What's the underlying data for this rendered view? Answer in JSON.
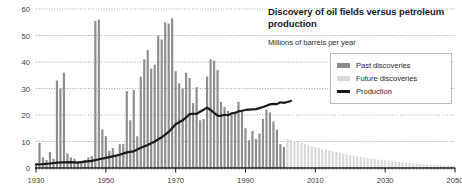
{
  "chart_data": {
    "type": "bar",
    "title": "Discovery of oil fields versus petroleum production",
    "subtitle": "Millions of barrels per year",
    "xlabel": "",
    "ylabel": "",
    "ylim": [
      0,
      60
    ],
    "xlim": [
      1930,
      2050
    ],
    "grid": true,
    "legend_position": "top-right",
    "y_ticks": [
      "0",
      "10",
      "20",
      "30",
      "40",
      "50",
      "60"
    ],
    "y_tick_values": [
      0,
      10,
      20,
      30,
      40,
      50,
      60
    ],
    "x_ticks": [
      "1930",
      "1950",
      "1970",
      "1990",
      "2010",
      "2030",
      "2050"
    ],
    "x_tick_values": [
      1930,
      1950,
      1970,
      1990,
      2010,
      2030,
      2050
    ],
    "series": [
      {
        "name": "Past discoveries",
        "type": "bar",
        "color": "#8d8d8d",
        "x": [
          1930,
          1931,
          1932,
          1933,
          1934,
          1935,
          1936,
          1937,
          1938,
          1939,
          1940,
          1941,
          1942,
          1943,
          1944,
          1945,
          1946,
          1947,
          1948,
          1949,
          1950,
          1951,
          1952,
          1953,
          1954,
          1955,
          1956,
          1957,
          1958,
          1959,
          1960,
          1961,
          1962,
          1963,
          1964,
          1965,
          1966,
          1967,
          1968,
          1969,
          1970,
          1971,
          1972,
          1973,
          1974,
          1975,
          1976,
          1977,
          1978,
          1979,
          1980,
          1981,
          1982,
          1983,
          1984,
          1985,
          1986,
          1987,
          1988,
          1989,
          1990,
          1991,
          1992,
          1993,
          1994,
          1995,
          1996,
          1997,
          1998,
          1999,
          2000,
          2001
        ],
        "values": [
          1.5,
          9.5,
          4.0,
          3.0,
          6.0,
          3.5,
          33.0,
          30.0,
          36.0,
          5.5,
          4.0,
          3.5,
          2.5,
          2.5,
          3.0,
          4.0,
          4.5,
          55.5,
          56.0,
          14.5,
          12.0,
          6.5,
          7.5,
          5.0,
          9.0,
          9.0,
          29.0,
          18.0,
          29.5,
          12.0,
          34.5,
          41.0,
          44.5,
          37.5,
          39.0,
          50.0,
          48.5,
          55.0,
          54.5,
          56.5,
          36.5,
          32.0,
          30.0,
          36.0,
          34.0,
          24.5,
          30.5,
          18.0,
          18.5,
          34.5,
          41.0,
          40.5,
          37.0,
          25.0,
          23.0,
          21.5,
          20.0,
          20.5,
          25.0,
          21.5,
          15.0,
          10.5,
          14.0,
          11.0,
          13.0,
          18.5,
          22.0,
          21.0,
          17.5,
          14.5,
          9.0,
          8.0
        ]
      },
      {
        "name": "Future discoveries",
        "type": "bar",
        "color": "#d9d9d9",
        "x": [
          2002,
          2003,
          2004,
          2005,
          2006,
          2007,
          2008,
          2009,
          2010,
          2011,
          2012,
          2013,
          2014,
          2015,
          2016,
          2017,
          2018,
          2019,
          2020,
          2021,
          2022,
          2023,
          2024,
          2025,
          2026,
          2027,
          2028,
          2029,
          2030,
          2031,
          2032,
          2033,
          2034,
          2035,
          2036,
          2037,
          2038,
          2039,
          2040,
          2041,
          2042,
          2043,
          2044,
          2045,
          2046,
          2047,
          2048,
          2049,
          2050
        ],
        "values": [
          11.0,
          10.6,
          10.2,
          9.8,
          9.4,
          9.0,
          8.6,
          8.2,
          7.9,
          7.5,
          7.2,
          6.9,
          6.6,
          6.3,
          6.0,
          5.7,
          5.4,
          5.1,
          4.9,
          4.6,
          4.4,
          4.2,
          4.0,
          3.8,
          3.6,
          3.4,
          3.2,
          3.0,
          2.9,
          2.7,
          2.6,
          2.4,
          2.3,
          2.1,
          2.0,
          1.9,
          1.8,
          1.7,
          1.6,
          1.5,
          1.4,
          1.3,
          1.2,
          1.1,
          1.0,
          0.9,
          0.8,
          0.7,
          0.6
        ]
      },
      {
        "name": "Production",
        "type": "line",
        "color": "#1a1a1a",
        "x": [
          1930,
          1932,
          1934,
          1936,
          1938,
          1940,
          1942,
          1944,
          1946,
          1948,
          1950,
          1952,
          1954,
          1956,
          1958,
          1960,
          1962,
          1964,
          1966,
          1968,
          1970,
          1972,
          1974,
          1976,
          1978,
          1979,
          1980,
          1981,
          1982,
          1983,
          1984,
          1985,
          1986,
          1987,
          1988,
          1989,
          1990,
          1991,
          1992,
          1993,
          1994,
          1995,
          1996,
          1997,
          1998,
          1999,
          2000,
          2001,
          2002,
          2003
        ],
        "values": [
          1.4,
          1.5,
          1.7,
          2.0,
          2.1,
          2.2,
          2.0,
          2.4,
          2.7,
          3.3,
          3.8,
          4.4,
          5.0,
          5.9,
          6.3,
          7.6,
          8.7,
          10.0,
          11.6,
          13.6,
          16.5,
          18.0,
          20.3,
          20.5,
          22.0,
          22.8,
          21.9,
          20.8,
          19.8,
          19.7,
          20.1,
          19.9,
          20.6,
          20.8,
          21.4,
          21.6,
          21.9,
          22.0,
          22.1,
          22.2,
          22.6,
          23.0,
          23.5,
          24.0,
          24.2,
          24.1,
          24.8,
          24.6,
          24.9,
          25.3
        ]
      }
    ]
  },
  "legend": {
    "items": [
      {
        "label": "Past discoveries",
        "swatch": "past"
      },
      {
        "label": "Future discoveries",
        "swatch": "future"
      },
      {
        "label": "Production",
        "swatch": "production"
      }
    ]
  },
  "colors": {
    "past_discoveries": "#8d8d8d",
    "future_discoveries": "#d9d9d9",
    "production": "#1a1a1a",
    "gridline": "#9a9a9a",
    "axis": "#1a1a1a",
    "background": "#ffffff"
  }
}
